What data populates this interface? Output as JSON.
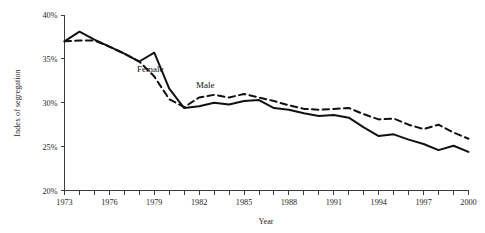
{
  "chart_data": {
    "type": "line",
    "title": "",
    "xlabel": "Year",
    "ylabel": "Index of segregation",
    "xlim": [
      1973,
      2000
    ],
    "ylim": [
      20,
      40
    ],
    "grid": false,
    "legend_position": "inline-annotation",
    "y_tick_labels": [
      "40%",
      "35%",
      "30%",
      "25%",
      "20%"
    ],
    "y_tick_values": [
      40,
      35,
      30,
      25,
      20
    ],
    "x_tick_values": [
      1973,
      1974,
      1975,
      1976,
      1977,
      1978,
      1979,
      1980,
      1981,
      1982,
      1983,
      1984,
      1985,
      1986,
      1987,
      1988,
      1989,
      1990,
      1991,
      1992,
      1993,
      1994,
      1995,
      1996,
      1997,
      1998,
      1999,
      2000
    ],
    "x_tick_labels_shown": [
      "1973",
      "1976",
      "1979",
      "1982",
      "1985",
      "1988",
      "1991",
      "1994",
      "1997",
      "2000"
    ],
    "x": [
      1973,
      1974,
      1975,
      1976,
      1977,
      1978,
      1979,
      1980,
      1981,
      1982,
      1983,
      1984,
      1985,
      1986,
      1987,
      1988,
      1989,
      1990,
      1991,
      1992,
      1993,
      1994,
      1995,
      1996,
      1997,
      1998,
      1999,
      2000
    ],
    "series": [
      {
        "name": "Female",
        "style": "solid",
        "color": "#111111",
        "label_text": "Female",
        "values": [
          37.0,
          38.1,
          37.2,
          36.4,
          35.6,
          34.7,
          35.7,
          31.6,
          29.4,
          29.6,
          30.0,
          29.8,
          30.2,
          30.3,
          29.4,
          29.2,
          28.8,
          28.5,
          28.6,
          28.3,
          27.2,
          26.2,
          26.4,
          25.8,
          25.3,
          24.6,
          25.1,
          24.4
        ]
      },
      {
        "name": "Male",
        "style": "dashed",
        "color": "#111111",
        "label_text": "Male",
        "values": [
          37.0,
          37.1,
          37.1,
          36.4,
          35.6,
          34.7,
          33.0,
          30.4,
          29.5,
          30.6,
          30.9,
          30.6,
          31.0,
          30.6,
          30.2,
          29.7,
          29.3,
          29.2,
          29.3,
          29.4,
          28.7,
          28.1,
          28.2,
          27.5,
          27.0,
          27.5,
          26.6,
          25.9
        ]
      }
    ]
  }
}
